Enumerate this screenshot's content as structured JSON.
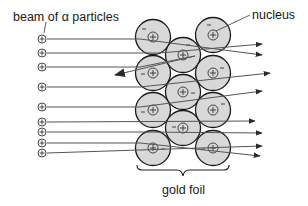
{
  "labels": {
    "beam": "beam of α particles",
    "nucleus": "nucleus",
    "foil": "gold foil"
  },
  "colors": {
    "atom_fill": "#d8d8d8",
    "atom_stroke": "#1a1a1a",
    "line": "#555555",
    "arrow": "#2a2a2a"
  },
  "atoms": [
    {
      "cx": 153,
      "cy": 37,
      "nuc": "+",
      "electron": "-",
      "ex": -9,
      "ey": -8
    },
    {
      "cx": 153,
      "cy": 73,
      "nuc": "+",
      "electron": "-",
      "ex": -10,
      "ey": 1
    },
    {
      "cx": 153,
      "cy": 110,
      "nuc": "+",
      "electron": "-",
      "ex": -10,
      "ey": 2
    },
    {
      "cx": 153,
      "cy": 148,
      "nuc": "+",
      "electron": "-",
      "ex": 10,
      "ey": 1
    },
    {
      "cx": 183,
      "cy": 55,
      "nuc": "+",
      "electron": "-",
      "ex": 5,
      "ey": -10
    },
    {
      "cx": 183,
      "cy": 92,
      "nuc": "+",
      "electron": "-",
      "ex": 10,
      "ey": 1
    },
    {
      "cx": 183,
      "cy": 128,
      "nuc": "+",
      "electron": "-",
      "ex": -9,
      "ey": -1
    },
    {
      "cx": 213,
      "cy": 35,
      "nuc": "+",
      "electron": "-",
      "ex": -4,
      "ey": -10
    },
    {
      "cx": 213,
      "cy": 73,
      "nuc": "+",
      "electron": "-",
      "ex": 9,
      "ey": -5
    },
    {
      "cx": 213,
      "cy": 110,
      "nuc": "+",
      "electron": "-",
      "ex": 10,
      "ey": -6
    },
    {
      "cx": 213,
      "cy": 148,
      "nuc": "+",
      "electron": "-",
      "ex": -10,
      "ey": 1
    }
  ],
  "alpha_particles": [
    {
      "y": 39
    },
    {
      "y": 53
    },
    {
      "y": 67
    },
    {
      "y": 87
    },
    {
      "y": 107
    },
    {
      "y": 122
    },
    {
      "y": 132
    },
    {
      "y": 143
    },
    {
      "y": 153
    }
  ],
  "trajectories": [
    {
      "points": [
        [
          47,
          39
        ],
        [
          140,
          39
        ],
        [
          262,
          55
        ]
      ]
    },
    {
      "points": [
        [
          47,
          53
        ],
        [
          160,
          53
        ],
        [
          262,
          44
        ]
      ]
    },
    {
      "points": [
        [
          47,
          67
        ],
        [
          140,
          67
        ],
        [
          195,
          56
        ],
        [
          115,
          75
        ]
      ]
    },
    {
      "points": [
        [
          47,
          87
        ],
        [
          140,
          87
        ],
        [
          270,
          73
        ]
      ]
    },
    {
      "points": [
        [
          47,
          107
        ],
        [
          140,
          107
        ],
        [
          262,
          91
        ]
      ]
    },
    {
      "points": [
        [
          47,
          122
        ],
        [
          255,
          121
        ]
      ]
    },
    {
      "points": [
        [
          47,
          132
        ],
        [
          140,
          132
        ],
        [
          262,
          133
        ]
      ]
    },
    {
      "points": [
        [
          47,
          143
        ],
        [
          140,
          143
        ],
        [
          260,
          156
        ]
      ]
    },
    {
      "points": [
        [
          47,
          153
        ],
        [
          262,
          146
        ]
      ]
    }
  ]
}
